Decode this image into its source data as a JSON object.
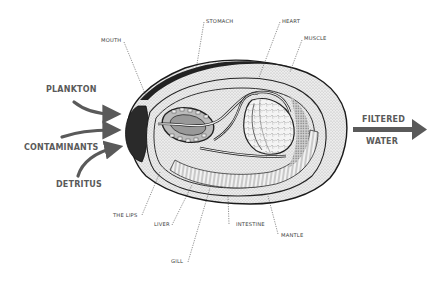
{
  "diagram": {
    "inputs": [
      {
        "id": "plankton",
        "label": "PLANKTON"
      },
      {
        "id": "contaminants",
        "label": "CONTAMINANTS"
      },
      {
        "id": "detritus",
        "label": "DETRITUS"
      }
    ],
    "output": {
      "line1": "FILTERED",
      "line2": "WATER"
    },
    "parts_top": [
      {
        "id": "mouth",
        "label": "MOUTH"
      },
      {
        "id": "stomach",
        "label": "STOMACH"
      },
      {
        "id": "heart",
        "label": "HEART"
      },
      {
        "id": "muscle",
        "label": "MUSCLE"
      }
    ],
    "parts_bottom": [
      {
        "id": "lips",
        "label": "THE LIPS"
      },
      {
        "id": "liver",
        "label": "LIVER"
      },
      {
        "id": "gill",
        "label": "GILL"
      },
      {
        "id": "intestine",
        "label": "INTESTINE"
      },
      {
        "id": "mantle",
        "label": "MANTLE"
      }
    ],
    "colors": {
      "arrow": "#5a5a5a",
      "label_big": "#5a5a5a",
      "label_small": "#3a3a3a",
      "outline": "#1a1a1a",
      "shell_fill": "#e8e8e8"
    }
  }
}
